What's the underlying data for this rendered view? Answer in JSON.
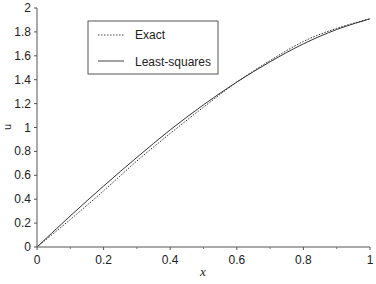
{
  "chart_data": {
    "type": "line",
    "title": "",
    "xlabel": "x",
    "ylabel": "u",
    "xlim": [
      0,
      1
    ],
    "ylim": [
      0,
      2
    ],
    "grid": false,
    "legend_position": "upper-left (inside)",
    "x_ticks": [
      "0",
      "0.2",
      "0.4",
      "0.6",
      "0.8",
      "1"
    ],
    "y_ticks": [
      "0",
      "0.2",
      "0.4",
      "0.6",
      "0.8",
      "1",
      "1.2",
      "1.4",
      "1.6",
      "1.8",
      "2"
    ],
    "x": [
      0,
      0.1,
      0.2,
      0.3,
      0.4,
      0.5,
      0.6,
      0.7,
      0.8,
      0.9,
      1.0
    ],
    "series": [
      {
        "name": "Exact",
        "style": "dotted",
        "values": [
          0,
          0.23,
          0.47,
          0.72,
          0.95,
          1.17,
          1.38,
          1.56,
          1.72,
          1.83,
          1.91
        ]
      },
      {
        "name": "Least-squares",
        "style": "solid",
        "values": [
          0,
          0.26,
          0.51,
          0.75,
          0.98,
          1.19,
          1.38,
          1.55,
          1.7,
          1.82,
          1.91
        ]
      }
    ]
  },
  "legend": {
    "items": [
      {
        "label": "Exact",
        "style": "dotted"
      },
      {
        "label": "Least-squares",
        "style": "solid"
      }
    ]
  },
  "axes": {
    "xlabel": "x",
    "ylabel": "u"
  }
}
